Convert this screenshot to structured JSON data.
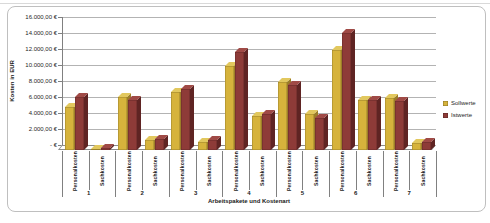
{
  "chart_data": {
    "type": "bar",
    "title": "",
    "xlabel": "Arbeitspakete und Kostenart",
    "ylabel": "Kosten in EUR",
    "ylim": [
      0,
      16000
    ],
    "y_tick_step": 2000,
    "grid": true,
    "legend_position": "right",
    "effect": "3d-clustered-column",
    "y_tick_labels": [
      "- €",
      "2.000,00 €",
      "4.000,00 €",
      "6.000,00 €",
      "8.000,00 €",
      "10.000,00 €",
      "12.000,00 €",
      "14.000,00 €",
      "16.000,00 €"
    ],
    "groups": [
      "1",
      "2",
      "3",
      "4",
      "5",
      "6",
      "7"
    ],
    "subcategory_labels": [
      "Personalkosten",
      "Sachkosten"
    ],
    "categories": [
      "1 Personalkosten",
      "1 Sachkosten",
      "2 Personalkosten",
      "2 Sachkosten",
      "3 Personalkosten",
      "3 Sachkosten",
      "4 Personalkosten",
      "4 Sachkosten",
      "5 Personalkosten",
      "5 Sachkosten",
      "6 Personalkosten",
      "6 Sachkosten",
      "7 Personalkosten",
      "7 Sachkosten"
    ],
    "series": [
      {
        "name": "Sollwerte",
        "color": "#d6b33c",
        "color_top": "#e2c85e",
        "color_side": "#9c7d28",
        "values": [
          5400,
          150,
          6600,
          1200,
          7200,
          1000,
          10500,
          4300,
          8500,
          4500,
          12500,
          6300,
          6500,
          900
        ]
      },
      {
        "name": "Istwerte",
        "color": "#8e3b38",
        "color_top": "#a04a46",
        "color_side": "#5f2423",
        "values": [
          6600,
          200,
          6300,
          1400,
          7600,
          1200,
          12200,
          4500,
          8100,
          4000,
          14600,
          6300,
          6100,
          1000
        ]
      }
    ],
    "colors": {
      "gridline": "#b3b3b3",
      "axis": "#808080",
      "frame_border": "#bfbfbf"
    }
  }
}
